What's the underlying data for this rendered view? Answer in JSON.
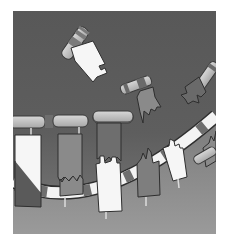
{
  "image": {
    "description": "Grayscale illustration: flag-like tags attached to cylindrical rods, some floating free, others hanging from a curved striped band at the bottom",
    "width": 227,
    "height": 246,
    "frame": {
      "x": 13,
      "y": 11,
      "width": 203,
      "height": 223
    },
    "colors": {
      "background_dark": "#5a5a5a",
      "background_light": "#8c8c8c",
      "band_white": "#f4f4f4",
      "band_dark": "#6e6e6e",
      "flag_white": "#f6f6f6",
      "flag_gray": "#8a8a8a",
      "flag_dark": "#6a6a6a",
      "rod_light": "#bdbdbd",
      "outline": "#2e2e2e"
    }
  }
}
